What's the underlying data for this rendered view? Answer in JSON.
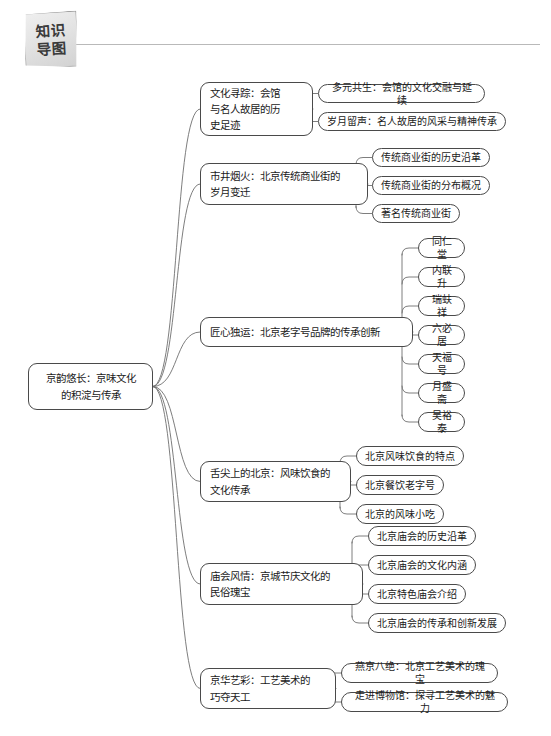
{
  "header": {
    "badge_line1": "知识",
    "badge_line2": "导图"
  },
  "mindmap": {
    "root": {
      "label": "京韵悠长：京味文化\n的积淀与传承"
    },
    "branches": [
      {
        "label": "文化寻踪：会馆\n与名人故居的历\n史足迹",
        "children": [
          "多元共生：会馆的文化交融与延续",
          "岁月留声：名人故居的风采与精神传承"
        ]
      },
      {
        "label": "市井烟火：北京传统商业街的\n岁月变迁",
        "children": [
          "传统商业街的历史沿革",
          "传统商业街的分布概况",
          "著名传统商业街"
        ]
      },
      {
        "label": "匠心独运：北京老字号品牌的传承创新",
        "children": [
          "同仁堂",
          "内联升",
          "瑞蚨祥",
          "六必居",
          "天福号",
          "月盛斋",
          "吴裕泰"
        ]
      },
      {
        "label": "舌尖上的北京：风味饮食的\n文化传承",
        "children": [
          "北京风味饮食的特点",
          "北京餐饮老字号",
          "北京的风味小吃"
        ]
      },
      {
        "label": "庙会风情：京城节庆文化的\n民俗瑰宝",
        "children": [
          "北京庙会的历史沿革",
          "北京庙会的文化内涵",
          "北京特色庙会介绍",
          "北京庙会的传承和创新发展"
        ]
      },
      {
        "label": "京华艺彩：工艺美术的\n巧夺天工",
        "children": [
          "燕京八绝：北京工艺美术的瑰宝",
          "走进博物馆：探寻工艺美术的魅力"
        ]
      }
    ]
  },
  "colors": {
    "node_border": "#4a4a4a",
    "edge": "#6f6f6f",
    "rule": "#b9b9b9",
    "badge_border": "#8d8d8d"
  }
}
